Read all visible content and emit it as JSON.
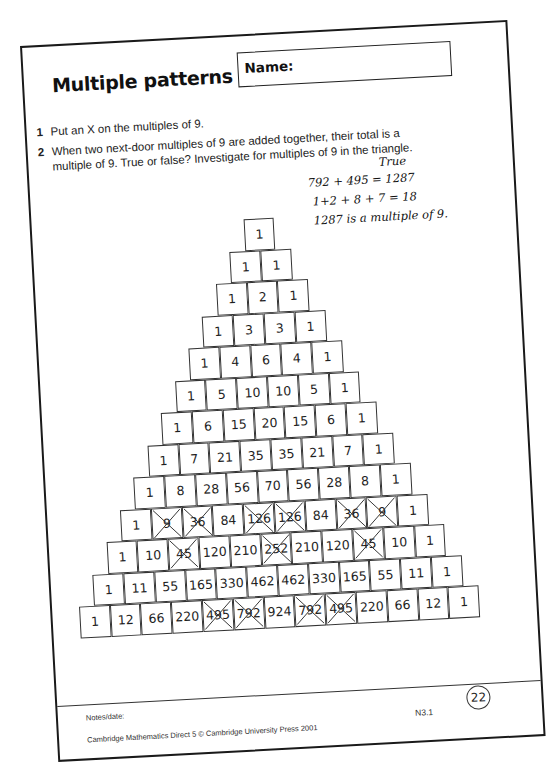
{
  "worksheet": {
    "title": "Multiple patterns",
    "name_label": "Name:",
    "questions": [
      {
        "number": "1",
        "text": "Put an X on the multiples of 9."
      },
      {
        "number": "2",
        "text_line1": "When two next-door multiples of 9 are added together, their total is a",
        "text_line2": "multiple of 9. True or false? Investigate for multiples of 9 in the triangle."
      }
    ],
    "handwritten_answer": {
      "verdict": "True",
      "line1": "792 + 495 = 1287",
      "line2": "1+2 + 8 + 7 = 18",
      "line3": "1287 is a multiple of 9."
    },
    "triangle": {
      "rows": [
        [
          1
        ],
        [
          1,
          1
        ],
        [
          1,
          2,
          1
        ],
        [
          1,
          3,
          3,
          1
        ],
        [
          1,
          4,
          6,
          4,
          1
        ],
        [
          1,
          5,
          10,
          10,
          5,
          1
        ],
        [
          1,
          6,
          15,
          20,
          15,
          6,
          1
        ],
        [
          1,
          7,
          21,
          35,
          35,
          21,
          7,
          1
        ],
        [
          1,
          8,
          28,
          56,
          70,
          56,
          28,
          8,
          1
        ],
        [
          1,
          9,
          36,
          84,
          126,
          126,
          84,
          36,
          9,
          1
        ],
        [
          1,
          10,
          45,
          120,
          210,
          252,
          210,
          120,
          45,
          10,
          1
        ],
        [
          1,
          11,
          55,
          165,
          330,
          462,
          462,
          330,
          165,
          55,
          11,
          1
        ],
        [
          1,
          12,
          66,
          220,
          495,
          792,
          924,
          792,
          495,
          220,
          66,
          12,
          1
        ]
      ],
      "crossed_out_marker": "X",
      "crossed_cells": [
        [
          9,
          1
        ],
        [
          9,
          2
        ],
        [
          9,
          4
        ],
        [
          9,
          5
        ],
        [
          9,
          7
        ],
        [
          9,
          8
        ],
        [
          10,
          2
        ],
        [
          10,
          5
        ],
        [
          10,
          8
        ],
        [
          12,
          4
        ],
        [
          12,
          5
        ],
        [
          12,
          7
        ],
        [
          12,
          8
        ]
      ]
    },
    "footer": {
      "notes_label": "Notes/date:",
      "copyright": "Cambridge Mathematics Direct 5  © Cambridge University Press 2001",
      "code": "N3.1",
      "page_number": "22"
    }
  },
  "colors": {
    "ink": "#1e1e1e",
    "border": "#1a1a1a",
    "paper": "#ffffff"
  }
}
